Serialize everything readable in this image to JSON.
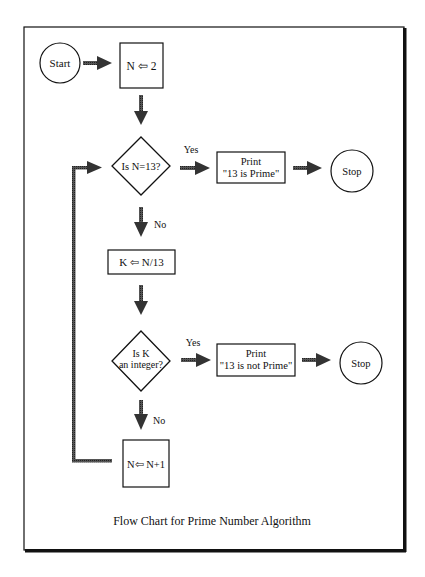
{
  "diagram": {
    "type": "flowchart",
    "caption": "Flow Chart for Prime Number Algorithm",
    "colors": {
      "line": "#111111",
      "arrow_fill": "#444444",
      "background": "#ffffff"
    },
    "nodes": {
      "start": {
        "shape": "circle",
        "label": "Start"
      },
      "init": {
        "shape": "box",
        "label": "N ⇦ 2"
      },
      "check_n": {
        "shape": "diamond",
        "label": "Is N=13?"
      },
      "print_prime": {
        "shape": "box",
        "line1": "Print",
        "line2": "\"13 is Prime\""
      },
      "stop1": {
        "shape": "circle",
        "label": "Stop"
      },
      "divide": {
        "shape": "box",
        "label": "K ⇦ N/13"
      },
      "check_k": {
        "shape": "diamond",
        "line1": "Is K",
        "line2": "an integer?"
      },
      "print_not_prime": {
        "shape": "box",
        "line1": "Print",
        "line2": "\"13 is not Prime\""
      },
      "stop2": {
        "shape": "circle",
        "label": "Stop"
      },
      "increment": {
        "shape": "box",
        "label": "N⇦ N+1"
      }
    },
    "edge_labels": {
      "check_n_yes": "Yes",
      "check_n_no": "No",
      "check_k_yes": "Yes",
      "check_k_no": "No"
    },
    "edges": [
      {
        "from": "start",
        "to": "init"
      },
      {
        "from": "init",
        "to": "check_n"
      },
      {
        "from": "check_n",
        "to": "print_prime",
        "label": "Yes"
      },
      {
        "from": "print_prime",
        "to": "stop1"
      },
      {
        "from": "check_n",
        "to": "divide",
        "label": "No"
      },
      {
        "from": "divide",
        "to": "check_k"
      },
      {
        "from": "check_k",
        "to": "print_not_prime",
        "label": "Yes"
      },
      {
        "from": "print_not_prime",
        "to": "stop2"
      },
      {
        "from": "check_k",
        "to": "increment",
        "label": "No"
      },
      {
        "from": "increment",
        "to": "check_n",
        "label": ""
      }
    ]
  }
}
